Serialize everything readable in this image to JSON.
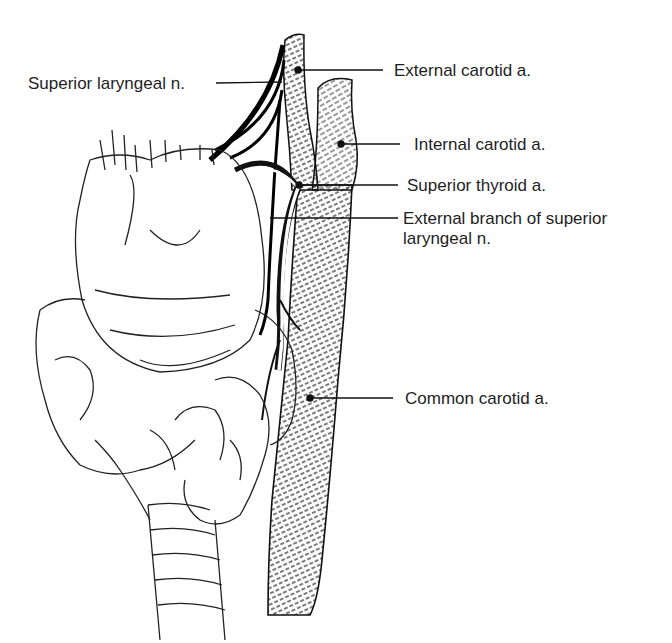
{
  "figure": {
    "type": "anatomical illustration",
    "labels": [
      {
        "id": "superior-laryngeal-n",
        "text": "Superior laryngeal n."
      },
      {
        "id": "external-carotid-a",
        "text": "External carotid a."
      },
      {
        "id": "internal-carotid-a",
        "text": "Internal carotid a."
      },
      {
        "id": "superior-thyroid-a",
        "text": "Superior thyroid a."
      },
      {
        "id": "external-branch-superior-laryngeal-n",
        "text": "External branch of superior laryngeal n."
      },
      {
        "id": "common-carotid-a",
        "text": "Common carotid a."
      }
    ]
  }
}
